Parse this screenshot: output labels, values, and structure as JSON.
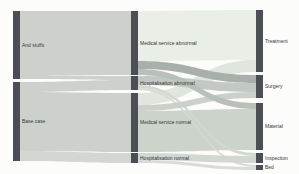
{
  "app": {
    "background": "#fcfcfb"
  },
  "chart_data": {
    "type": "sankey",
    "title": "",
    "orientation": "horizontal",
    "legend": "none",
    "grid": "off",
    "canvas": {
      "width": 299,
      "height": 174
    },
    "node_color": "#4c4e55",
    "label_color": "#35383b",
    "node_width": 7,
    "columns": [
      "scenario",
      "service-type",
      "cost-item"
    ],
    "nodes": [
      {
        "id": "and-stuffs",
        "label": "And stuffs",
        "column": 0,
        "x": 13,
        "y": 11,
        "h": 68
      },
      {
        "id": "base-case",
        "label": "Base case",
        "column": 0,
        "x": 13,
        "y": 82,
        "h": 79
      },
      {
        "id": "medical-service-abnormal",
        "label": "Medical service abnormal",
        "column": 1,
        "x": 131,
        "y": 11,
        "h": 64
      },
      {
        "id": "hospitalisation-abnormal",
        "label": "Hospitalisation abnormal",
        "column": 1,
        "x": 131,
        "y": 76,
        "h": 14
      },
      {
        "id": "medical-service-normal",
        "label": "Medical service normal",
        "column": 1,
        "x": 131,
        "y": 93,
        "h": 59
      },
      {
        "id": "hospitalisation-normal",
        "label": "Hospitalisation normal",
        "column": 1,
        "x": 131,
        "y": 153,
        "h": 10
      },
      {
        "id": "treatment",
        "label": "Treatment",
        "column": 2,
        "x": 256,
        "y": 10,
        "h": 62
      },
      {
        "id": "surgery",
        "label": "Surgery",
        "column": 2,
        "x": 256,
        "y": 75,
        "h": 23
      },
      {
        "id": "material",
        "label": "Material",
        "column": 2,
        "x": 256,
        "y": 103,
        "h": 47
      },
      {
        "id": "inspection",
        "label": "Inspection",
        "column": 2,
        "x": 256,
        "y": 153,
        "h": 10
      },
      {
        "id": "bed",
        "label": "Bed",
        "column": 2,
        "x": 256,
        "y": 165,
        "h": 5
      }
    ],
    "links": [
      {
        "source": "and-stuffs",
        "target": "medical-service-abnormal",
        "value": 64,
        "color": "#ccd2cb",
        "z": 0
      },
      {
        "source": "and-stuffs",
        "target": "hospitalisation-abnormal",
        "value": 4,
        "color": "#ccd2cb",
        "z": 0
      },
      {
        "source": "base-case",
        "target": "hospitalisation-abnormal",
        "value": 10,
        "color": "#ccd2cb",
        "z": 0
      },
      {
        "source": "base-case",
        "target": "medical-service-normal",
        "value": 59,
        "color": "#ccd2cb",
        "z": 0
      },
      {
        "source": "base-case",
        "target": "hospitalisation-normal",
        "value": 10,
        "color": "#d2d7d1",
        "z": 0
      },
      {
        "source": "medical-service-abnormal",
        "target": "treatment",
        "value": 50,
        "color": "#e9eee6",
        "z": -1
      },
      {
        "source": "medical-service-abnormal",
        "target": "surgery",
        "value": 8,
        "color": "#a9b0ab",
        "z": 3
      },
      {
        "source": "medical-service-abnormal",
        "target": "material",
        "value": 6,
        "color": "#b9c0ba",
        "z": 2
      },
      {
        "source": "hospitalisation-abnormal",
        "target": "surgery",
        "value": 9,
        "color": "#c2c9c2",
        "z": 1
      },
      {
        "source": "hospitalisation-abnormal",
        "target": "inspection",
        "value": 3,
        "color": "#d2d7d1",
        "z": 1
      },
      {
        "source": "hospitalisation-abnormal",
        "target": "bed",
        "value": 2,
        "color": "#d5dad4",
        "z": 1
      },
      {
        "source": "medical-service-normal",
        "target": "treatment",
        "value": 12,
        "color": "#e0e6dd",
        "z": -1
      },
      {
        "source": "medical-service-normal",
        "target": "surgery",
        "value": 6,
        "color": "#cbd1ca",
        "z": 1
      },
      {
        "source": "medical-service-normal",
        "target": "material",
        "value": 41,
        "color": "#ccd3cb",
        "z": 0
      },
      {
        "source": "hospitalisation-normal",
        "target": "inspection",
        "value": 7,
        "color": "#d2d7d1",
        "z": 1
      },
      {
        "source": "hospitalisation-normal",
        "target": "bed",
        "value": 3,
        "color": "#d8dcd6",
        "z": 1
      }
    ]
  }
}
